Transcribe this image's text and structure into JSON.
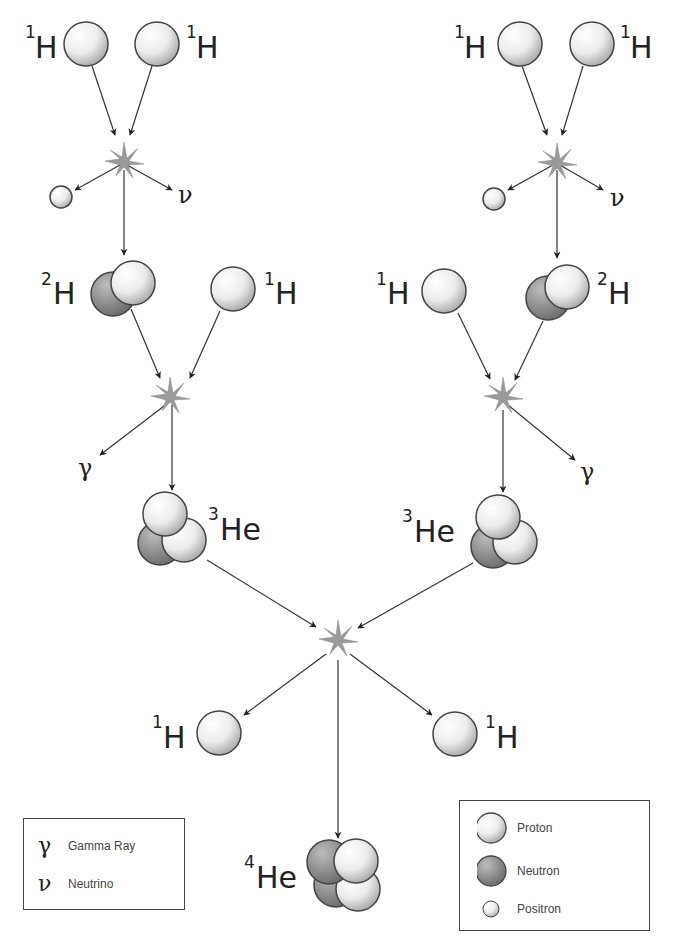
{
  "labels": {
    "h1": {
      "sup": "1",
      "sym": "H"
    },
    "h2": {
      "sup": "2",
      "sym": "H"
    },
    "he3": {
      "sup": "3",
      "sym": "He"
    },
    "he4": {
      "sup": "4",
      "sym": "He"
    },
    "gamma": "γ",
    "neutrino": "ν"
  },
  "legend_left": {
    "items": [
      {
        "symbol": "γ",
        "label": "Gamma Ray"
      },
      {
        "symbol": "ν",
        "label": "Neutrino"
      }
    ]
  },
  "legend_right": {
    "items": [
      {
        "icon": "proton",
        "label": "Proton"
      },
      {
        "icon": "neutron",
        "label": "Neutron"
      },
      {
        "icon": "positron",
        "label": "Positron"
      }
    ]
  },
  "colors": {
    "proton_light": "#ffffff",
    "proton_dark": "#a9a9a9",
    "neutron_light": "#b5b5b5",
    "neutron_dark": "#6e6e6e",
    "outline": "#444444",
    "arrow": "#333333",
    "star": "#999999"
  }
}
